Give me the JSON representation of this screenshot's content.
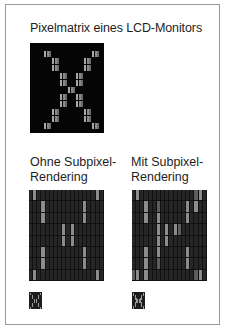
{
  "figure": {
    "title": "Pixelmatrix eines LCD-Monitors",
    "panels": [
      {
        "id": "without",
        "label": "Ohne Subpixel-\nRendering"
      },
      {
        "id": "with",
        "label": "Mit Subpixel-\nRendering"
      }
    ]
  },
  "colors": {
    "frame_border": "#9a9a9a",
    "matrix_bg": "#050505",
    "grid_bg": "#262626",
    "lit_subpixel": "#8c8c8c",
    "half_subpixel": "#5e5e5e"
  },
  "grids": {
    "cols": 18,
    "rows": 8,
    "without": {
      "lit": [
        [
          0,
          1
        ],
        [
          0,
          16
        ],
        [
          1,
          3
        ],
        [
          1,
          13
        ],
        [
          2,
          3
        ],
        [
          2,
          13
        ],
        [
          3,
          8
        ],
        [
          3,
          10
        ],
        [
          4,
          8
        ],
        [
          4,
          10
        ],
        [
          5,
          3
        ],
        [
          5,
          13
        ],
        [
          6,
          3
        ],
        [
          6,
          13
        ],
        [
          7,
          1
        ],
        [
          7,
          16
        ]
      ],
      "half": []
    },
    "with": {
      "lit": [
        [
          0,
          1
        ],
        [
          0,
          16
        ],
        [
          1,
          3
        ],
        [
          1,
          15
        ],
        [
          1,
          13
        ],
        [
          2,
          3
        ],
        [
          2,
          13
        ],
        [
          2,
          6
        ],
        [
          3,
          6
        ],
        [
          3,
          8
        ],
        [
          3,
          10
        ],
        [
          4,
          6
        ],
        [
          4,
          8
        ],
        [
          5,
          6
        ],
        [
          5,
          3
        ],
        [
          5,
          13
        ],
        [
          6,
          3
        ],
        [
          6,
          13
        ],
        [
          7,
          1
        ],
        [
          7,
          3
        ],
        [
          7,
          16
        ]
      ],
      "half": [
        [
          0,
          15
        ],
        [
          1,
          6
        ],
        [
          3,
          11
        ],
        [
          6,
          6
        ],
        [
          7,
          15
        ],
        [
          7,
          0
        ]
      ]
    }
  }
}
